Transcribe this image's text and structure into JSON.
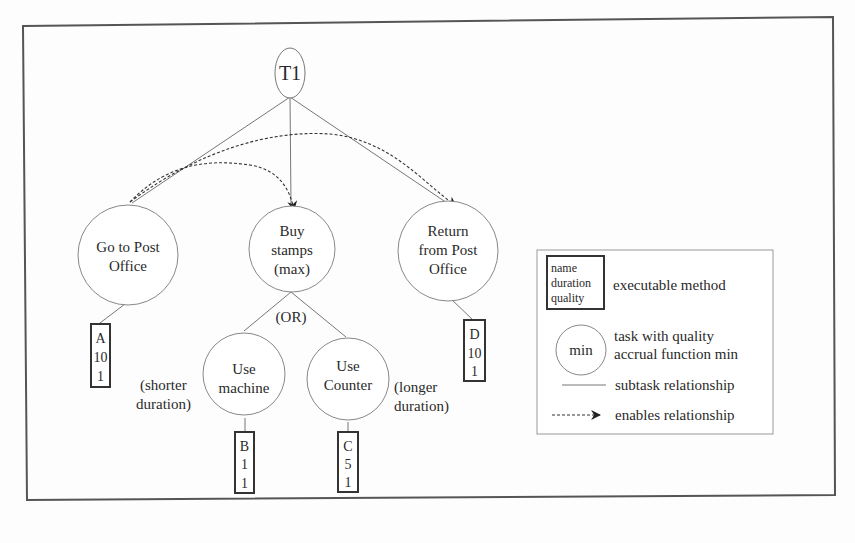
{
  "diagram": {
    "root": {
      "id": "T1",
      "label": "T1"
    },
    "tasks": [
      {
        "id": "go",
        "lines": [
          "Go to Post",
          "Office"
        ]
      },
      {
        "id": "buy",
        "lines": [
          "Buy",
          "stamps",
          "(max)"
        ]
      },
      {
        "id": "ret",
        "lines": [
          "Return",
          "from  Post",
          "Office"
        ]
      },
      {
        "id": "machine",
        "lines": [
          "Use",
          "machine"
        ]
      },
      {
        "id": "counter",
        "lines": [
          "Use",
          "Counter"
        ]
      }
    ],
    "methods": [
      {
        "id": "A",
        "name": "A",
        "duration": "10",
        "quality": "1"
      },
      {
        "id": "B",
        "name": "B",
        "duration": "1",
        "quality": "1"
      },
      {
        "id": "C",
        "name": "C",
        "duration": "5",
        "quality": "1"
      },
      {
        "id": "D",
        "name": "D",
        "duration": "10",
        "quality": "1"
      }
    ],
    "annotations": {
      "or_label": "(OR)",
      "shorter": [
        "(shorter",
        "duration)"
      ],
      "longer": [
        "(longer",
        "duration)"
      ]
    },
    "subtask_edges": [
      [
        "T1",
        "go"
      ],
      [
        "T1",
        "buy"
      ],
      [
        "T1",
        "ret"
      ],
      [
        "go",
        "A"
      ],
      [
        "buy",
        "machine"
      ],
      [
        "buy",
        "counter"
      ],
      [
        "machine",
        "B"
      ],
      [
        "counter",
        "C"
      ],
      [
        "ret",
        "D"
      ]
    ],
    "enables_edges": [
      [
        "go",
        "buy"
      ],
      [
        "go",
        "ret"
      ]
    ]
  },
  "legend": {
    "method_box_lines": [
      "name",
      "duration",
      "quality"
    ],
    "method_label": "executable method",
    "task_circle_label": "min",
    "task_lines": [
      "task with quality",
      "accrual function min"
    ],
    "subtask_label": "subtask relationship",
    "enables_label": "enables relationship"
  }
}
